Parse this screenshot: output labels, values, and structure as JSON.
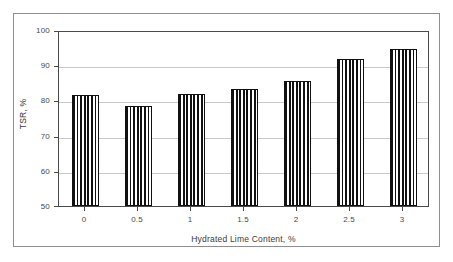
{
  "figure": {
    "frame_color": "#8f8f8f",
    "background": "#ffffff"
  },
  "chart_data": {
    "type": "bar",
    "title": "",
    "subtitle": "",
    "xlabel": "Hydrated Lime Content, %",
    "ylabel": "TSR, %",
    "categories": [
      "0",
      "0.5",
      "1",
      "1.5",
      "2",
      "2.5",
      "3"
    ],
    "values": [
      81.4,
      78.5,
      81.9,
      83.3,
      85.6,
      91.7,
      94.6
    ],
    "ylim": [
      50,
      100
    ],
    "yticks": [
      "50",
      "60",
      "70",
      "80",
      "90",
      "100"
    ],
    "ytick_values": [
      50,
      60,
      70,
      80,
      90,
      100
    ],
    "grid": "horizontal",
    "legend": "none",
    "bar_fill": "vertical-stripes",
    "bar_edge_color": "#111111",
    "gridline_color": "#c9c9c9",
    "axis_color": "#4a4a4a"
  }
}
